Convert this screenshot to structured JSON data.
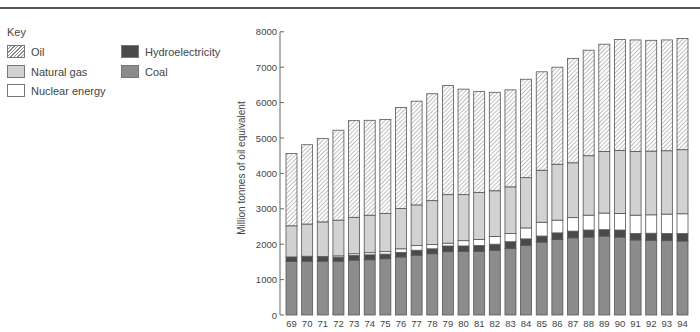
{
  "key": {
    "title": "Key",
    "items": [
      {
        "label": "Oil",
        "swatch": "oil",
        "pattern": "hatched"
      },
      {
        "label": "Natural gas",
        "swatch": "gas",
        "color": "#d2d2d2"
      },
      {
        "label": "Nuclear energy",
        "swatch": "nuc",
        "color": "#ffffff"
      },
      {
        "label": "Hydroelectricity",
        "swatch": "hyd",
        "color": "#4a4a4a"
      },
      {
        "label": "Coal",
        "swatch": "coal",
        "color": "#8c8c8c"
      }
    ]
  },
  "chart_data": {
    "type": "bar",
    "stacked": true,
    "title": "",
    "xlabel": "",
    "ylabel": "Million tonnes of oil equivalent",
    "ylim": [
      0,
      8000
    ],
    "yticks": [
      0,
      1000,
      2000,
      3000,
      4000,
      5000,
      6000,
      7000,
      8000
    ],
    "grid": false,
    "legend_position": "top-left (Key)",
    "categories": [
      "69",
      "70",
      "71",
      "72",
      "73",
      "74",
      "75",
      "76",
      "77",
      "78",
      "79",
      "80",
      "81",
      "82",
      "83",
      "84",
      "85",
      "86",
      "87",
      "88",
      "89",
      "90",
      "91",
      "92",
      "93",
      "94"
    ],
    "series": [
      {
        "name": "Coal",
        "color": "#8c8c8c",
        "values": [
          1510,
          1520,
          1520,
          1520,
          1550,
          1560,
          1590,
          1640,
          1690,
          1730,
          1790,
          1800,
          1800,
          1830,
          1880,
          1970,
          2060,
          2130,
          2180,
          2200,
          2230,
          2200,
          2120,
          2110,
          2100,
          2090
        ]
      },
      {
        "name": "Hydroelectricity",
        "color": "#4a4a4a",
        "values": [
          130,
          130,
          120,
          110,
          130,
          140,
          130,
          130,
          140,
          140,
          160,
          150,
          160,
          170,
          190,
          180,
          170,
          190,
          190,
          200,
          180,
          200,
          180,
          200,
          200,
          210
        ]
      },
      {
        "name": "Nuclear energy",
        "color": "#ffffff",
        "values": [
          0,
          10,
          10,
          40,
          50,
          60,
          70,
          100,
          130,
          120,
          80,
          150,
          170,
          220,
          230,
          310,
          390,
          360,
          380,
          420,
          470,
          470,
          520,
          520,
          550,
          560
        ]
      },
      {
        "name": "Natural gas",
        "color": "#d2d2d2",
        "values": [
          880,
          910,
          980,
          1010,
          1030,
          1060,
          1080,
          1140,
          1150,
          1240,
          1370,
          1300,
          1330,
          1290,
          1320,
          1420,
          1470,
          1580,
          1550,
          1680,
          1740,
          1780,
          1800,
          1800,
          1790,
          1810
        ]
      },
      {
        "name": "Oil",
        "pattern": "hatched",
        "values": [
          2040,
          2240,
          2360,
          2540,
          2730,
          2680,
          2650,
          2850,
          2930,
          3020,
          3080,
          2980,
          2850,
          2780,
          2740,
          2780,
          2780,
          2740,
          2950,
          2980,
          3030,
          3130,
          3150,
          3130,
          3130,
          3140
        ]
      }
    ],
    "totals": [
      4560,
      4810,
      4990,
      5220,
      5490,
      5500,
      5520,
      5860,
      6040,
      6250,
      6480,
      6380,
      6310,
      6290,
      6360,
      6660,
      6870,
      7000,
      7250,
      7480,
      7650,
      7780,
      7770,
      7760,
      7770,
      7810
    ]
  }
}
